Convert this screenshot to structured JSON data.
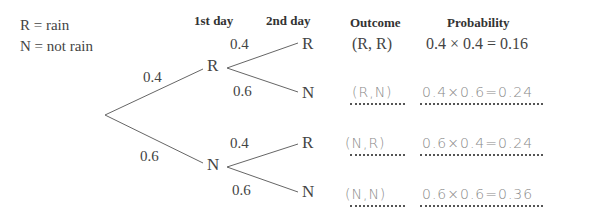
{
  "key": {
    "line1": "R = rain",
    "line2": "N = not rain"
  },
  "headers": {
    "day1": "1st day",
    "day2": "2nd day",
    "outcome": "Outcome",
    "probability": "Probability"
  },
  "tree": {
    "first": [
      {
        "node": "R",
        "prob": "0.4"
      },
      {
        "node": "N",
        "prob": "0.6"
      }
    ],
    "second": [
      {
        "node": "R",
        "prob": "0.4"
      },
      {
        "node": "N",
        "prob": "0.6"
      },
      {
        "node": "R",
        "prob": "0.4"
      },
      {
        "node": "N",
        "prob": "0.6"
      }
    ]
  },
  "rows": [
    {
      "outcome": "(R, R)",
      "probability": "0.4 × 0.4 = 0.16",
      "handwritten": false
    },
    {
      "outcome": "(R,N)",
      "probability": "0.4×0.6=0.24",
      "handwritten": true
    },
    {
      "outcome": "(N,R)",
      "probability": "0.6×0.4=0.24",
      "handwritten": true
    },
    {
      "outcome": "(N,N)",
      "probability": "0.6×0.6=0.36",
      "handwritten": true
    }
  ]
}
